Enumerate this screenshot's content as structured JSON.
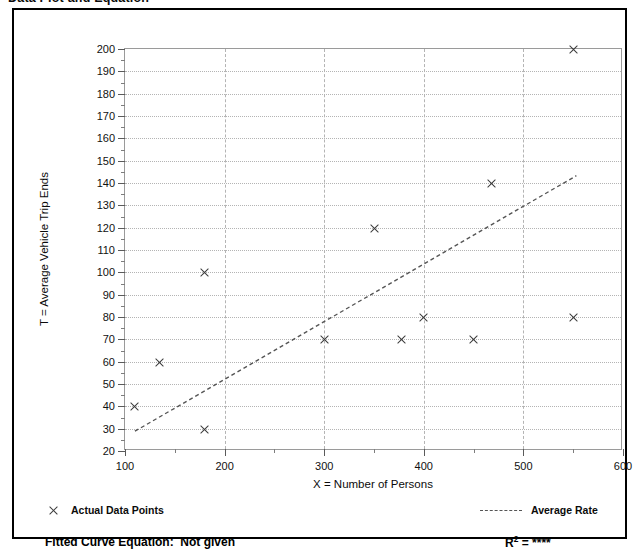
{
  "page_title": "Data Plot and Equation",
  "chart_data": {
    "type": "scatter",
    "title": "Data Plot and Equation",
    "xlabel": "X = Number of Persons",
    "ylabel": "T = Average Vehicle Trip Ends",
    "xlim": [
      100,
      600
    ],
    "ylim": [
      20,
      200
    ],
    "x_ticks": [
      100,
      200,
      300,
      400,
      500,
      600
    ],
    "x_tick_labels": [
      "100",
      "200",
      "300",
      "400",
      "500",
      "600"
    ],
    "x_minor_ticks": [
      150,
      250,
      350,
      450,
      550
    ],
    "y_ticks": [
      20,
      30,
      40,
      50,
      60,
      70,
      80,
      90,
      100,
      110,
      120,
      130,
      140,
      150,
      160,
      170,
      180,
      190,
      200
    ],
    "y_tick_labels": [
      "20",
      "30",
      "40",
      "50",
      "60",
      "70",
      "80",
      "90",
      "100",
      "110",
      "120",
      "130",
      "140",
      "150",
      "160",
      "170",
      "180",
      "190",
      "200"
    ],
    "grid": true,
    "grid_x_values": [
      200,
      300,
      400,
      500
    ],
    "legend_position": "below-axes",
    "series": [
      {
        "name": "Actual Data Points",
        "marker": "x",
        "color": "#3b3b3b",
        "points": [
          {
            "x": 110,
            "y": 40
          },
          {
            "x": 135,
            "y": 60
          },
          {
            "x": 180,
            "y": 30
          },
          {
            "x": 180,
            "y": 100
          },
          {
            "x": 300,
            "y": 70
          },
          {
            "x": 350,
            "y": 120
          },
          {
            "x": 378,
            "y": 70
          },
          {
            "x": 400,
            "y": 80
          },
          {
            "x": 450,
            "y": 70
          },
          {
            "x": 468,
            "y": 140
          },
          {
            "x": 550,
            "y": 80
          },
          {
            "x": 550,
            "y": 200
          }
        ]
      },
      {
        "name": "Average Rate",
        "marker": "dashed-line",
        "color": "#555555",
        "line_endpoints": [
          {
            "x": 110,
            "y": 28
          },
          {
            "x": 555,
            "y": 143
          }
        ]
      }
    ]
  },
  "legend": {
    "data_points_label": "Actual Data Points",
    "average_rate_label": "Average Rate"
  },
  "footer": {
    "fitted_curve_label": "Fitted Curve Equation:",
    "fitted_curve_value": "Not given",
    "r_squared_label": "R",
    "r_squared_exponent": "2",
    "r_squared_equals": " = ",
    "r_squared_value": "****"
  }
}
